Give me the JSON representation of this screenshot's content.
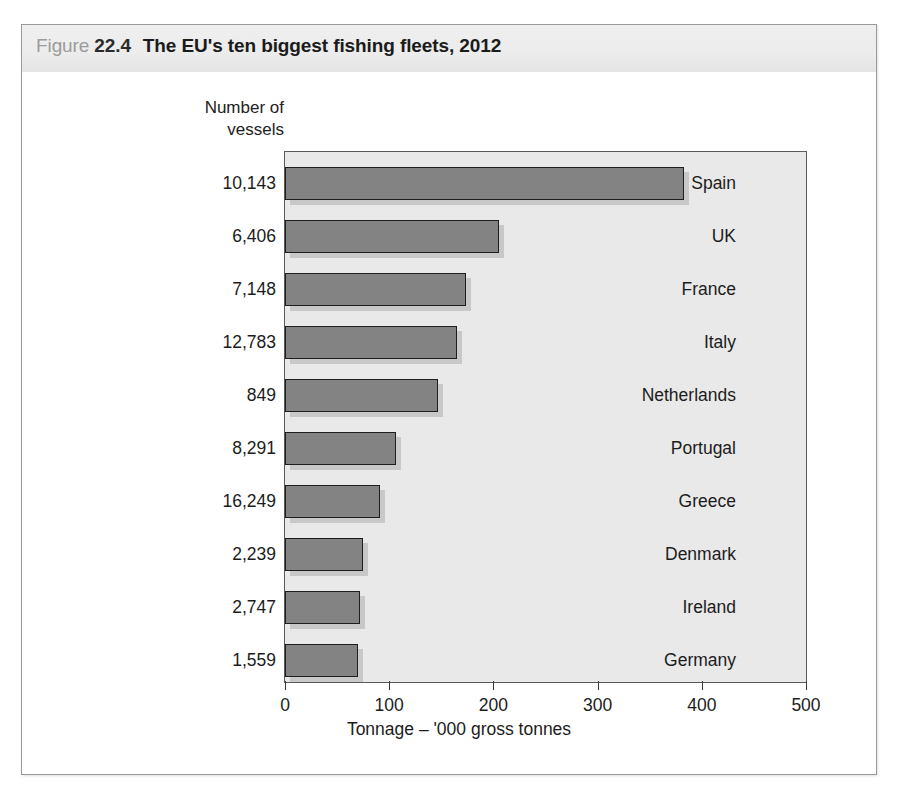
{
  "figure": {
    "label_word": "Figure",
    "number": "22.4",
    "title": "The EU's ten biggest fishing fleets, 2012"
  },
  "columns": {
    "vessels_header_line1": "Number of",
    "vessels_header_line2": "vessels"
  },
  "axis": {
    "x_title": "Tonnage – '000 gross tonnes",
    "ticks": [
      "0",
      "100",
      "200",
      "300",
      "400",
      "500"
    ]
  },
  "rows": [
    {
      "country": "Spain",
      "vessels": "10,143",
      "tonnage": 383
    },
    {
      "country": "UK",
      "vessels": "6,406",
      "tonnage": 205
    },
    {
      "country": "France",
      "vessels": "7,148",
      "tonnage": 174
    },
    {
      "country": "Italy",
      "vessels": "12,783",
      "tonnage": 165
    },
    {
      "country": "Netherlands",
      "vessels": "849",
      "tonnage": 147
    },
    {
      "country": "Portugal",
      "vessels": "8,291",
      "tonnage": 107
    },
    {
      "country": "Greece",
      "vessels": "16,249",
      "tonnage": 91
    },
    {
      "country": "Denmark",
      "vessels": "2,239",
      "tonnage": 75
    },
    {
      "country": "Ireland",
      "vessels": "2,747",
      "tonnage": 72
    },
    {
      "country": "Germany",
      "vessels": "1,559",
      "tonnage": 70
    }
  ],
  "chart_data": {
    "type": "bar",
    "orientation": "horizontal",
    "title": "The EU's ten biggest fishing fleets, 2012",
    "xlabel": "Tonnage – '000 gross tonnes",
    "ylabel": "",
    "xlim": [
      0,
      500
    ],
    "xticks": [
      0,
      100,
      200,
      300,
      400,
      500
    ],
    "grid": false,
    "legend": false,
    "categories": [
      "Spain",
      "UK",
      "France",
      "Italy",
      "Netherlands",
      "Portugal",
      "Greece",
      "Denmark",
      "Ireland",
      "Germany"
    ],
    "series": [
      {
        "name": "Tonnage – '000 gross tonnes",
        "values": [
          383,
          205,
          174,
          165,
          147,
          107,
          91,
          75,
          72,
          70
        ]
      },
      {
        "name": "Number of vessels",
        "display": "text-column",
        "values": [
          10143,
          6406,
          7148,
          12783,
          849,
          8291,
          16249,
          2239,
          2747,
          1559
        ]
      }
    ],
    "colors": {
      "bar_fill": "#838383",
      "bar_border": "#1e1e1e",
      "plot_background": "#e9e9e9",
      "title_band": "#ececec"
    }
  }
}
